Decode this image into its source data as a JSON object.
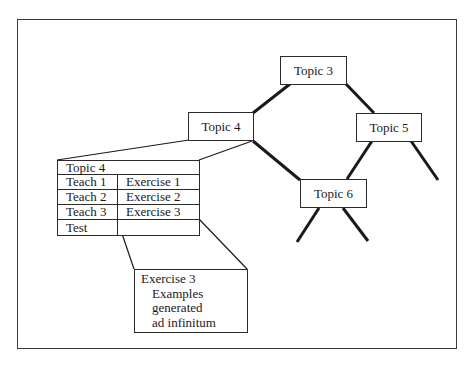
{
  "diagram": {
    "type": "tree",
    "nodes": [
      {
        "id": "topic3",
        "label": "Topic 3",
        "x": 280,
        "y": 56,
        "w": 67,
        "h": 29
      },
      {
        "id": "topic4",
        "label": "Topic 4",
        "x": 188,
        "y": 112,
        "w": 66,
        "h": 29
      },
      {
        "id": "topic5",
        "label": "Topic 5",
        "x": 356,
        "y": 113,
        "w": 66,
        "h": 29
      },
      {
        "id": "topic6",
        "label": "Topic 6",
        "x": 300,
        "y": 179,
        "w": 67,
        "h": 29
      }
    ],
    "edges": [
      {
        "from": "topic3",
        "to": "topic4",
        "x1": 290,
        "y1": 84,
        "x2": 253,
        "y2": 113
      },
      {
        "from": "topic3",
        "to": "topic5",
        "x1": 346,
        "y1": 84,
        "x2": 374,
        "y2": 113
      },
      {
        "from": "topic4",
        "to": "topic6",
        "x1": 253,
        "y1": 141,
        "x2": 300,
        "y2": 180
      },
      {
        "from": "topic5",
        "to": "topic6",
        "x1": 372,
        "y1": 141,
        "x2": 347,
        "y2": 179
      },
      {
        "from": "topic5",
        "to": "(child)",
        "x1": 411,
        "y1": 141,
        "x2": 438,
        "y2": 180
      },
      {
        "from": "topic6",
        "to": "(child-left)",
        "x1": 319,
        "y1": 208,
        "x2": 297,
        "y2": 242
      },
      {
        "from": "topic6",
        "to": "(child-right)",
        "x1": 343,
        "y1": 208,
        "x2": 368,
        "y2": 241
      }
    ],
    "zoom_lines": [
      {
        "x1": 189,
        "y1": 140,
        "x2": 57,
        "y2": 160
      },
      {
        "x1": 252,
        "y1": 141,
        "x2": 199,
        "y2": 160
      },
      {
        "x1": 117,
        "y1": 219,
        "x2": 134,
        "y2": 269
      },
      {
        "x1": 199,
        "y1": 219,
        "x2": 247,
        "y2": 269
      }
    ],
    "topic_table": {
      "title": "Topic 4",
      "rows": [
        {
          "left": "Teach 1",
          "right": "Exercise 1"
        },
        {
          "left": "Teach 2",
          "right": "Exercise 2"
        },
        {
          "left": "Teach 3",
          "right": "Exercise 3"
        },
        {
          "left": "Test",
          "right": ""
        }
      ]
    },
    "detail_box": {
      "title": "Exercise 3",
      "lines": [
        "Examples",
        "generated",
        "ad  infinitum"
      ]
    },
    "colors": {
      "stroke": "#1a1a1a",
      "frame": "#3a3a3a",
      "background": "#ffffff"
    }
  }
}
